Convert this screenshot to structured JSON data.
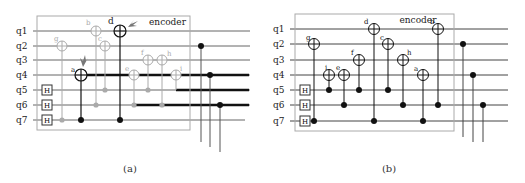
{
  "panels": [
    {
      "id": "a",
      "caption": "(a)",
      "box_label": "encoder",
      "wire_labels": [
        "q1",
        "q2",
        "q3",
        "q4",
        "q5",
        "q6",
        "q7"
      ],
      "hadamard_label": "H",
      "hadamard_wires": [
        "q5",
        "q6",
        "q7"
      ],
      "gate_labels": {
        "a": "a",
        "b": "b",
        "c": "c",
        "d": "d",
        "e": "e",
        "f": "f",
        "g": "g",
        "h": "h",
        "i": "i"
      }
    },
    {
      "id": "b",
      "caption": "(b)",
      "box_label": "encoder",
      "wire_labels": [
        "q1",
        "q2",
        "q3",
        "q4",
        "q5",
        "q6",
        "q7"
      ],
      "hadamard_label": "H",
      "hadamard_wires": [
        "q5",
        "q6",
        "q7"
      ],
      "gate_labels": {
        "a": "a",
        "b": "b",
        "c": "c",
        "d": "d",
        "e": "e",
        "f": "f",
        "g": "g",
        "h": "h",
        "i": "i"
      }
    }
  ],
  "colors": {
    "wire": "#555555",
    "box": "#999999",
    "gate_dark": "#111111",
    "gate_faded": "#aaaaaa",
    "arrow": "#666666"
  }
}
